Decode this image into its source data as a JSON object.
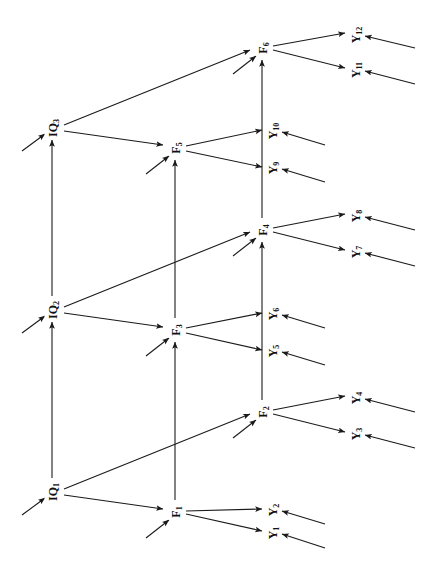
{
  "figure": {
    "type": "path-diagram",
    "orientation": "rotated-90-ccw",
    "background_color": "#ffffff",
    "stroke_color": "#1a1a1a",
    "label_color": "#111111"
  },
  "nodes": {
    "iq": [
      {
        "id": "IQ1",
        "base": "IQ",
        "sub": "1",
        "x": 52,
        "y": 492
      },
      {
        "id": "IQ2",
        "base": "IQ",
        "sub": "2",
        "x": 52,
        "y": 310
      },
      {
        "id": "IQ3",
        "base": "IQ",
        "sub": "3",
        "x": 52,
        "y": 128
      }
    ],
    "factors": [
      {
        "id": "F1",
        "base": "F",
        "sub": "1",
        "x": 175,
        "y": 512
      },
      {
        "id": "F2",
        "base": "F",
        "sub": "2",
        "x": 262,
        "y": 412
      },
      {
        "id": "F3",
        "base": "F",
        "sub": "3",
        "x": 175,
        "y": 330
      },
      {
        "id": "F4",
        "base": "F",
        "sub": "4",
        "x": 262,
        "y": 230
      },
      {
        "id": "F5",
        "base": "F",
        "sub": "5",
        "x": 175,
        "y": 148
      },
      {
        "id": "F6",
        "base": "F",
        "sub": "6",
        "x": 262,
        "y": 48
      }
    ],
    "indicators": [
      {
        "id": "Y1",
        "base": "Y",
        "sub": "1",
        "x": 272,
        "y": 533
      },
      {
        "id": "Y2",
        "base": "Y",
        "sub": "2",
        "x": 272,
        "y": 510
      },
      {
        "id": "Y3",
        "base": "Y",
        "sub": "3",
        "x": 355,
        "y": 434
      },
      {
        "id": "Y4",
        "base": "Y",
        "sub": "4",
        "x": 355,
        "y": 398
      },
      {
        "id": "Y5",
        "base": "Y",
        "sub": "5",
        "x": 272,
        "y": 351
      },
      {
        "id": "Y6",
        "base": "Y",
        "sub": "6",
        "x": 272,
        "y": 314
      },
      {
        "id": "Y7",
        "base": "Y",
        "sub": "7",
        "x": 355,
        "y": 252
      },
      {
        "id": "Y8",
        "base": "Y",
        "sub": "8",
        "x": 355,
        "y": 216
      },
      {
        "id": "Y9",
        "base": "Y",
        "sub": "9",
        "x": 272,
        "y": 168
      },
      {
        "id": "Y10",
        "base": "Y",
        "sub": "10",
        "x": 272,
        "y": 131
      },
      {
        "id": "Y11",
        "base": "Y",
        "sub": "11",
        "x": 355,
        "y": 70
      },
      {
        "id": "Y12",
        "base": "Y",
        "sub": "12",
        "x": 355,
        "y": 35
      }
    ]
  },
  "edges": {
    "iq_chain": [
      {
        "from": "IQ1",
        "to": "IQ2",
        "x1": 52,
        "y1": 478,
        "x2": 52,
        "y2": 322
      },
      {
        "from": "IQ2",
        "to": "IQ3",
        "x1": 52,
        "y1": 296,
        "x2": 52,
        "y2": 140
      }
    ],
    "factor_chain": [
      {
        "from": "F1",
        "to": "F3",
        "x1": 175,
        "y1": 500,
        "x2": 175,
        "y2": 342
      },
      {
        "from": "F3",
        "to": "F5",
        "x1": 175,
        "y1": 318,
        "x2": 175,
        "y2": 160
      },
      {
        "from": "F2",
        "to": "F4",
        "x1": 262,
        "y1": 400,
        "x2": 262,
        "y2": 242
      },
      {
        "from": "F4",
        "to": "F6",
        "x1": 262,
        "y1": 218,
        "x2": 262,
        "y2": 60
      }
    ],
    "iq_to_factor": [
      {
        "from": "IQ1",
        "to": "F1",
        "x1": 64,
        "y1": 495,
        "x2": 163,
        "y2": 509
      },
      {
        "from": "IQ1",
        "to": "F2",
        "x1": 64,
        "y1": 489,
        "x2": 250,
        "y2": 414
      },
      {
        "from": "IQ2",
        "to": "F3",
        "x1": 64,
        "y1": 313,
        "x2": 163,
        "y2": 327
      },
      {
        "from": "IQ2",
        "to": "F4",
        "x1": 64,
        "y1": 307,
        "x2": 250,
        "y2": 232
      },
      {
        "from": "IQ3",
        "to": "F5",
        "x1": 64,
        "y1": 131,
        "x2": 163,
        "y2": 145
      },
      {
        "from": "IQ3",
        "to": "F6",
        "x1": 64,
        "y1": 125,
        "x2": 250,
        "y2": 50
      }
    ],
    "factor_to_indicator": [
      {
        "from": "F1",
        "to": "Y1",
        "x1": 186,
        "y1": 514,
        "x2": 262,
        "y2": 531
      },
      {
        "from": "F1",
        "to": "Y2",
        "x1": 186,
        "y1": 511,
        "x2": 262,
        "y2": 509
      },
      {
        "from": "F2",
        "to": "Y3",
        "x1": 273,
        "y1": 414,
        "x2": 345,
        "y2": 432
      },
      {
        "from": "F2",
        "to": "Y4",
        "x1": 273,
        "y1": 410,
        "x2": 345,
        "y2": 396
      },
      {
        "from": "F3",
        "to": "Y5",
        "x1": 186,
        "y1": 333,
        "x2": 262,
        "y2": 350
      },
      {
        "from": "F3",
        "to": "Y6",
        "x1": 186,
        "y1": 328,
        "x2": 262,
        "y2": 313
      },
      {
        "from": "F4",
        "to": "Y7",
        "x1": 273,
        "y1": 232,
        "x2": 345,
        "y2": 250
      },
      {
        "from": "F4",
        "to": "Y8",
        "x1": 273,
        "y1": 228,
        "x2": 345,
        "y2": 214
      },
      {
        "from": "F5",
        "to": "Y9",
        "x1": 186,
        "y1": 151,
        "x2": 262,
        "y2": 167
      },
      {
        "from": "F5",
        "to": "Y10",
        "x1": 186,
        "y1": 146,
        "x2": 262,
        "y2": 130
      },
      {
        "from": "F6",
        "to": "Y11",
        "x1": 273,
        "y1": 50,
        "x2": 345,
        "y2": 68
      },
      {
        "from": "F6",
        "to": "Y12",
        "x1": 273,
        "y1": 46,
        "x2": 345,
        "y2": 33
      }
    ],
    "disturbances": [
      {
        "to": "IQ1",
        "x1": 22,
        "y1": 515,
        "x2": 45,
        "y2": 498
      },
      {
        "to": "IQ2",
        "x1": 22,
        "y1": 333,
        "x2": 45,
        "y2": 316
      },
      {
        "to": "IQ3",
        "x1": 22,
        "y1": 151,
        "x2": 45,
        "y2": 134
      },
      {
        "to": "F1",
        "x1": 146,
        "y1": 538,
        "x2": 169,
        "y2": 520
      },
      {
        "to": "F2",
        "x1": 233,
        "y1": 438,
        "x2": 256,
        "y2": 420
      },
      {
        "to": "F3",
        "x1": 146,
        "y1": 356,
        "x2": 169,
        "y2": 338
      },
      {
        "to": "F4",
        "x1": 233,
        "y1": 256,
        "x2": 256,
        "y2": 238
      },
      {
        "to": "F5",
        "x1": 146,
        "y1": 174,
        "x2": 169,
        "y2": 156
      },
      {
        "to": "F6",
        "x1": 233,
        "y1": 74,
        "x2": 256,
        "y2": 56
      }
    ],
    "residuals": [
      {
        "to": "Y1",
        "x1": 325,
        "y1": 548,
        "x2": 282,
        "y2": 534
      },
      {
        "to": "Y2",
        "x1": 325,
        "y1": 524,
        "x2": 282,
        "y2": 511
      },
      {
        "to": "Y3",
        "x1": 415,
        "y1": 448,
        "x2": 365,
        "y2": 435
      },
      {
        "to": "Y4",
        "x1": 415,
        "y1": 412,
        "x2": 365,
        "y2": 399
      },
      {
        "to": "Y5",
        "x1": 325,
        "y1": 365,
        "x2": 282,
        "y2": 352
      },
      {
        "to": "Y6",
        "x1": 325,
        "y1": 328,
        "x2": 282,
        "y2": 315
      },
      {
        "to": "Y7",
        "x1": 415,
        "y1": 266,
        "x2": 365,
        "y2": 253
      },
      {
        "to": "Y8",
        "x1": 415,
        "y1": 230,
        "x2": 365,
        "y2": 217
      },
      {
        "to": "Y9",
        "x1": 325,
        "y1": 182,
        "x2": 282,
        "y2": 169
      },
      {
        "to": "Y10",
        "x1": 325,
        "y1": 145,
        "x2": 282,
        "y2": 132
      },
      {
        "to": "Y11",
        "x1": 415,
        "y1": 84,
        "x2": 365,
        "y2": 71
      },
      {
        "to": "Y12",
        "x1": 415,
        "y1": 48,
        "x2": 365,
        "y2": 36
      }
    ]
  }
}
